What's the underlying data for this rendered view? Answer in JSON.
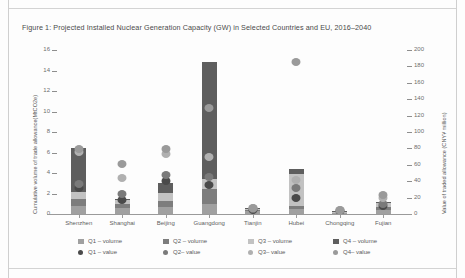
{
  "figure": {
    "title": "Figure 1: Projected Installed Nuclear Generation Capacity (GW) in Selected Countries and EU, 2016–2040"
  },
  "chart_data": {
    "type": "bar",
    "title": "Figure 1: Projected Installed Nuclear Generation Capacity (GW) in Selected Countries and EU, 2016–2040",
    "xlabel": "",
    "ylabel": "Cumulative volume of trade allowance(MtCO2e)",
    "y2label": "Value of traded allowance (CNY¥ million)",
    "categories": [
      "Shenzhen",
      "Shanghai",
      "Beijing",
      "Guangdong",
      "Tianjin",
      "Hubei",
      "Chongqing",
      "Fujian"
    ],
    "ylim": [
      0,
      16
    ],
    "yticks": [
      0,
      2,
      4,
      6,
      8,
      10,
      12,
      14,
      16
    ],
    "y2lim": [
      0,
      200
    ],
    "y2ticks": [
      0,
      20,
      40,
      60,
      80,
      100,
      120,
      140,
      160,
      180,
      200
    ],
    "grid": false,
    "legend_position": "bottom",
    "series": [
      {
        "name": "Q1 – volume",
        "type": "bar",
        "color": "#a0a0a0",
        "values": [
          0.75,
          0.55,
          0.7,
          1.0,
          0.25,
          0.45,
          0.1,
          0.4
        ]
      },
      {
        "name": "Q2 – volume",
        "type": "bar",
        "color": "#7d7d7d",
        "values": [
          0.7,
          0.45,
          0.55,
          1.45,
          0.15,
          0.35,
          0.08,
          0.3
        ]
      },
      {
        "name": "Q3 – volume",
        "type": "bar",
        "color": "#c2c2c2",
        "values": [
          0.65,
          0.35,
          0.8,
          0.95,
          0.1,
          3.1,
          0.05,
          0.35
        ]
      },
      {
        "name": "Q4 – volume",
        "type": "bar",
        "color": "#5e5e5e",
        "values": [
          4.3,
          0.15,
          1.0,
          11.4,
          0.05,
          0.45,
          0.03,
          0.15
        ]
      },
      {
        "name": "Q1 – value",
        "type": "scatter",
        "color": "#4a4a4a",
        "values": [
          2.55,
          1.35,
          3.25,
          2.85,
          0.35,
          1.6,
          0.25,
          0.75
        ]
      },
      {
        "name": "Q2 – value",
        "type": "scatter",
        "color": "#7a7a7a",
        "values": [
          2.95,
          2.0,
          3.8,
          3.65,
          0.45,
          2.55,
          0.3,
          0.95
        ]
      },
      {
        "name": "Q3 – value",
        "type": "scatter",
        "color": "#b0b0b0",
        "values": [
          6.05,
          3.55,
          5.9,
          5.55,
          0.55,
          3.35,
          0.35,
          1.55
        ]
      },
      {
        "name": "Q4 – value",
        "type": "scatter",
        "color": "#9a9a9a",
        "values": [
          6.35,
          4.85,
          6.35,
          10.35,
          0.6,
          14.8,
          0.4,
          1.85
        ]
      }
    ]
  },
  "legend": {
    "items": [
      {
        "label": "Q1 – volume",
        "marker": "square",
        "color": "#a0a0a0"
      },
      {
        "label": "Q2 – volume",
        "marker": "square",
        "color": "#7d7d7d"
      },
      {
        "label": "Q3 – volume",
        "marker": "square",
        "color": "#c2c2c2"
      },
      {
        "label": "Q4 – volume",
        "marker": "square",
        "color": "#5e5e5e"
      },
      {
        "label": "Q1 – value",
        "marker": "circle",
        "color": "#4a4a4a"
      },
      {
        "label": "Q2– value",
        "marker": "circle",
        "color": "#7a7a7a"
      },
      {
        "label": "Q3– value",
        "marker": "circle",
        "color": "#b0b0b0"
      },
      {
        "label": "Q4– value",
        "marker": "circle",
        "color": "#9a9a9a"
      }
    ]
  }
}
